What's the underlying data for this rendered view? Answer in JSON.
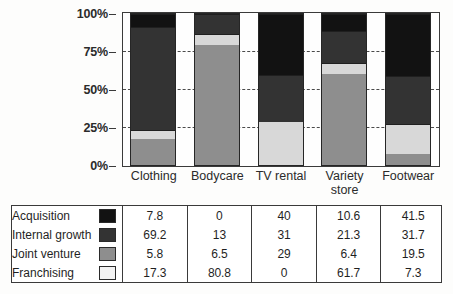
{
  "chart_data": {
    "type": "bar",
    "stacked": true,
    "stack_mode": "percent",
    "title": "",
    "subtitle": "",
    "xlabel": "",
    "ylabel": "",
    "ylim": [
      0,
      100
    ],
    "ytick_labels": [
      "0%",
      "25%",
      "50%",
      "75%",
      "100%"
    ],
    "ytick_values": [
      0,
      25,
      50,
      75,
      100
    ],
    "grid": "horizontal-dashed-between-bars",
    "legend_position": "table-below",
    "categories": [
      "Clothing",
      "Bodycare",
      "TV rental",
      "Variety store",
      "Footwear"
    ],
    "stack_order_bottom_to_top": [
      "Franchising",
      "Joint venture",
      "Internal growth",
      "Acquisition"
    ],
    "series": [
      {
        "name": "Acquisition",
        "color": "#121212",
        "values": [
          7.8,
          0,
          40,
          10.6,
          41.5
        ]
      },
      {
        "name": "Internal growth",
        "color": "#333333",
        "values": [
          69.2,
          13,
          31,
          21.3,
          31.7
        ]
      },
      {
        "name": "Joint venture",
        "color": "#d8d8d8",
        "values": [
          5.8,
          6.5,
          29,
          6.4,
          19.5
        ]
      },
      {
        "name": "Franchising",
        "color": "#8e8e8e",
        "values": [
          17.3,
          80.8,
          0,
          61.7,
          7.3
        ]
      }
    ],
    "legend_swatch_colors": {
      "Acquisition": "#121212",
      "Internal growth": "#333333",
      "Joint venture": "#8e8e8e",
      "Franchising": "#f2f2f2"
    }
  },
  "axis": {
    "ticks": [
      {
        "label": "100%",
        "value": 100
      },
      {
        "label": "75%",
        "value": 75
      },
      {
        "label": "50%",
        "value": 50
      },
      {
        "label": "25%",
        "value": 25
      },
      {
        "label": "0%",
        "value": 0
      }
    ]
  },
  "categories": [
    {
      "label": "Clothing",
      "line1": "Clothing",
      "line2": ""
    },
    {
      "label": "Bodycare",
      "line1": "Bodycare",
      "line2": ""
    },
    {
      "label": "TV rental",
      "line1": "TV rental",
      "line2": ""
    },
    {
      "label": "Variety store",
      "line1": "Variety",
      "line2": "store"
    },
    {
      "label": "Footwear",
      "line1": "Footwear",
      "line2": ""
    }
  ],
  "table": {
    "rows": [
      {
        "label": "Acquisition",
        "swatch": "acquisition-swatch",
        "values": [
          "7.8",
          "0",
          "40",
          "10.6",
          "41.5"
        ]
      },
      {
        "label": "Internal growth",
        "swatch": "internal-growth-swatch",
        "values": [
          "69.2",
          "13",
          "31",
          "21.3",
          "31.7"
        ]
      },
      {
        "label": "Joint venture",
        "swatch": "joint-venture-swatch",
        "values": [
          "5.8",
          "6.5",
          "29",
          "6.4",
          "19.5"
        ]
      },
      {
        "label": "Franchising",
        "swatch": "franchising-swatch",
        "values": [
          "17.3",
          "80.8",
          "0",
          "61.7",
          "7.3"
        ]
      }
    ]
  }
}
